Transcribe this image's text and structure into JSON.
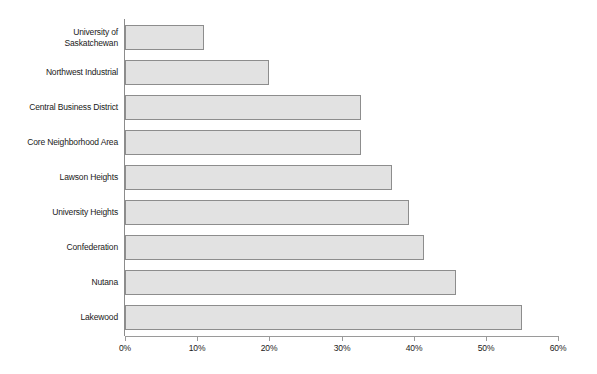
{
  "chart_data": {
    "type": "bar",
    "orientation": "horizontal",
    "title": "",
    "subtitle": "",
    "xlabel": "",
    "ylabel": "",
    "xlim": [
      0,
      60
    ],
    "xtick_values": [
      0,
      10,
      20,
      30,
      40,
      50,
      60
    ],
    "xtick_labels": [
      "0%",
      "10%",
      "20%",
      "30%",
      "40%",
      "50%",
      "60%"
    ],
    "grid": false,
    "legend": false,
    "legend_position": "none",
    "value_format": "percent",
    "categories": [
      "University of Saskatchewan",
      "Northwest Industrial",
      "Central Business District",
      "Core Neighborhood Area",
      "Lawson Heights",
      "University Heights",
      "Confederation",
      "Nutana",
      "Lakewood"
    ],
    "values": [
      11.0,
      20.0,
      32.7,
      32.7,
      37.0,
      39.4,
      41.5,
      45.8,
      55.0
    ],
    "bars": [
      {
        "label": "University of Saskatchewan",
        "label_lines": [
          "University of",
          "Saskatchewan"
        ],
        "value": 11.0
      },
      {
        "label": "Northwest Industrial",
        "label_lines": [
          "Northwest Industrial"
        ],
        "value": 20.0
      },
      {
        "label": "Central Business District",
        "label_lines": [
          "Central Business District"
        ],
        "value": 32.7
      },
      {
        "label": "Core Neighborhood Area",
        "label_lines": [
          "Core Neighborhood Area"
        ],
        "value": 32.7
      },
      {
        "label": "Lawson Heights",
        "label_lines": [
          "Lawson Heights"
        ],
        "value": 37.0
      },
      {
        "label": "University Heights",
        "label_lines": [
          "University Heights"
        ],
        "value": 39.4
      },
      {
        "label": "Confederation",
        "label_lines": [
          "Confederation"
        ],
        "value": 41.5
      },
      {
        "label": "Nutana",
        "label_lines": [
          "Nutana"
        ],
        "value": 45.8
      },
      {
        "label": "Lakewood",
        "label_lines": [
          "Lakewood"
        ],
        "value": 55.0
      }
    ],
    "colors": {
      "bar_fill": "#e2e2e2",
      "bar_border": "#8d8d8d",
      "axis": "#9a9a9a",
      "text": "#1a1a1a",
      "background": "#ffffff"
    }
  }
}
